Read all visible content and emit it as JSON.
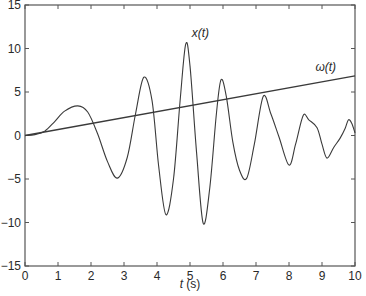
{
  "chart_data": {
    "type": "line",
    "title": "",
    "xlabel": "t (s)",
    "xlabel_italic_part": "t",
    "xlabel_unit_part": " (s)",
    "ylabel": "",
    "xlim": [
      0,
      10
    ],
    "ylim": [
      -15,
      15
    ],
    "xticks": [
      0,
      1,
      2,
      3,
      4,
      5,
      6,
      7,
      8,
      9,
      10
    ],
    "yticks": [
      -15,
      -10,
      -5,
      0,
      5,
      10,
      15
    ],
    "xtick_labels": [
      "0",
      "1",
      "2",
      "3",
      "4",
      "5",
      "6",
      "7",
      "8",
      "9",
      "10"
    ],
    "ytick_labels": [
      "−15",
      "−10",
      "−5",
      "0",
      "5",
      "10",
      "15"
    ],
    "grid": false,
    "legend": null,
    "annotations": [
      {
        "text": "x(t)",
        "x": 5.05,
        "y": 11.3,
        "series": "x(t)"
      },
      {
        "text": "ω(t)",
        "x": 8.8,
        "y": 7.4,
        "series": "omega(t)"
      }
    ],
    "series": [
      {
        "name": "x(t)",
        "x": [
          0,
          0.3,
          0.6,
          0.9,
          1.2,
          1.6,
          1.9,
          2.2,
          2.5,
          2.8,
          3.1,
          3.35,
          3.6,
          3.85,
          4.05,
          4.27,
          4.5,
          4.7,
          4.87,
          5.0,
          5.2,
          5.4,
          5.6,
          5.8,
          5.94,
          6.1,
          6.3,
          6.5,
          6.72,
          6.95,
          7.22,
          7.45,
          7.7,
          8.0,
          8.2,
          8.43,
          8.6,
          8.85,
          9.0,
          9.15,
          9.35,
          9.55,
          9.7,
          9.8,
          9.9,
          10.0
        ],
        "values": [
          0,
          0.1,
          0.5,
          1.6,
          2.8,
          3.4,
          2.7,
          0.2,
          -3.0,
          -4.9,
          -2.5,
          2.5,
          6.7,
          4.0,
          -3.5,
          -9.1,
          -5.0,
          4.0,
          10.5,
          8.0,
          -2.0,
          -10.1,
          -6.0,
          2.5,
          6.4,
          4.5,
          -0.8,
          -4.0,
          -4.9,
          -1.0,
          4.5,
          2.5,
          -0.2,
          -3.4,
          -1.0,
          2.3,
          1.8,
          0.9,
          -1.0,
          -2.6,
          -1.4,
          -0.3,
          0.8,
          1.8,
          1.4,
          0.3
        ]
      },
      {
        "name": "omega(t)",
        "x": [
          0,
          10
        ],
        "values": [
          0,
          6.85
        ]
      }
    ],
    "style": {
      "line_color": "#3a3a3a",
      "axis_color": "#555555",
      "background": "#ffffff"
    }
  }
}
